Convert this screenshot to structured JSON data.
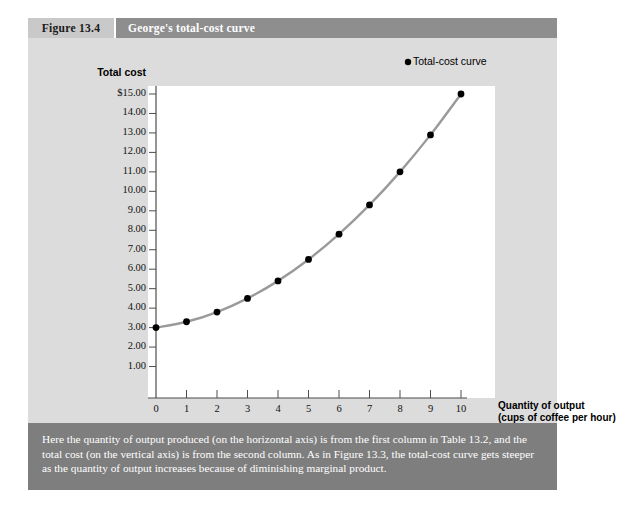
{
  "figure": {
    "number_label": "Figure 13.4",
    "title": "George's total-cost curve",
    "caption": "Here the quantity of output produced (on the horizontal axis) is from the first column in Table 13.2, and the total cost (on the vertical axis) is from the second column. As in Figure 13.3, the total-cost curve gets steeper as the quantity of output increases because of diminishing marginal product."
  },
  "colors": {
    "tab_bg": "#c9c9c9",
    "title_bg": "#8e8e8e",
    "body_bg": "#dcdcdc",
    "caption_bg": "#7e7e7e",
    "plot_bg": "#ffffff",
    "curve": "#9a9a9a",
    "marker": "#000000",
    "axis": "#4d4d4d"
  },
  "chart_data": {
    "type": "line",
    "title": "George's total-cost curve",
    "xlabel": "Quantity of output",
    "xlabel_line2": "(cups of coffee per hour)",
    "ylabel": "Total cost",
    "series_name": "Total-cost curve",
    "annotation": "Total-cost curve",
    "x": [
      0,
      1,
      2,
      3,
      4,
      5,
      6,
      7,
      8,
      9,
      10
    ],
    "values": [
      3.0,
      3.3,
      3.8,
      4.5,
      5.4,
      6.5,
      7.8,
      9.3,
      11.0,
      12.9,
      15.0
    ],
    "xlim": [
      0,
      10
    ],
    "ylim": [
      0,
      15
    ],
    "grid": false,
    "legend": "none",
    "x_ticks": [
      "0",
      "1",
      "2",
      "3",
      "4",
      "5",
      "6",
      "7",
      "8",
      "9",
      "10"
    ],
    "y_ticks": [
      "$15.00",
      "14.00",
      "13.00",
      "12.00",
      "11.00",
      "10.00",
      "9.00",
      "8.00",
      "7.00",
      "6.00",
      "5.00",
      "4.00",
      "3.00",
      "2.00",
      "1.00"
    ],
    "y_tick_values": [
      15,
      14,
      13,
      12,
      11,
      10,
      9,
      8,
      7,
      6,
      5,
      4,
      3,
      2,
      1
    ]
  }
}
